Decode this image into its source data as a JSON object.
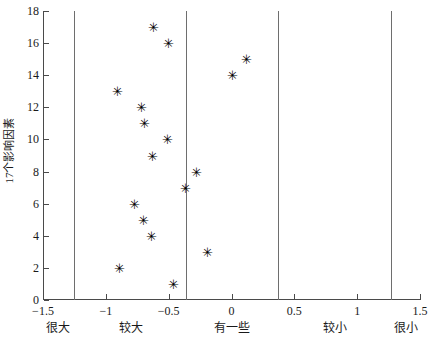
{
  "chart_data": {
    "type": "scatter",
    "title": "",
    "xlabel": "",
    "ylabel": "17个影响因素",
    "xlim": [
      -1.5,
      1.5
    ],
    "ylim": [
      0,
      18
    ],
    "grid": false,
    "legend": null,
    "marker": "asterisk",
    "xticks": [
      "-1.5",
      "-1",
      "-0.5",
      "0",
      "0.5",
      "1",
      "1.5"
    ],
    "xtick_values": [
      -1.5,
      -1,
      -0.5,
      0,
      0.5,
      1,
      1.5
    ],
    "yticks": [
      "0",
      "2",
      "4",
      "6",
      "8",
      "10",
      "12",
      "14",
      "16",
      "18"
    ],
    "ytick_values": [
      0,
      2,
      4,
      6,
      8,
      10,
      12,
      14,
      16,
      18
    ],
    "category_labels": [
      "很大",
      "较大",
      "有一些",
      "较小",
      "很小"
    ],
    "category_label_positions": [
      -1.38,
      -0.8,
      0.0,
      0.82,
      1.39
    ],
    "category_dividers": [
      -1.25,
      -0.36,
      0.37,
      1.27
    ],
    "points": [
      {
        "index": 1,
        "x": -0.46
      },
      {
        "index": 2,
        "x": -0.89
      },
      {
        "index": 3,
        "x": -0.19
      },
      {
        "index": 4,
        "x": -0.64
      },
      {
        "index": 5,
        "x": -0.7
      },
      {
        "index": 6,
        "x": -0.77
      },
      {
        "index": 7,
        "x": -0.37
      },
      {
        "index": 8,
        "x": -0.28
      },
      {
        "index": 9,
        "x": -0.63
      },
      {
        "index": 10,
        "x": -0.51
      },
      {
        "index": 11,
        "x": -0.69
      },
      {
        "index": 12,
        "x": -0.72
      },
      {
        "index": 13,
        "x": -0.91
      },
      {
        "index": 14,
        "x": 0.01
      },
      {
        "index": 15,
        "x": 0.12
      },
      {
        "index": 16,
        "x": -0.5
      },
      {
        "index": 17,
        "x": -0.62
      }
    ],
    "marker_glyph": "✳"
  },
  "caption": ""
}
